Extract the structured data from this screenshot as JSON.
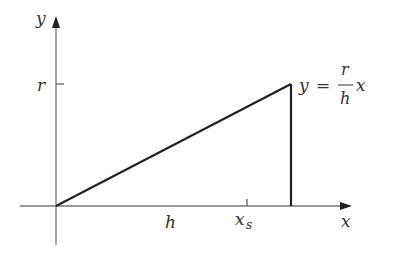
{
  "diagram": {
    "axes": {
      "x_label": "x",
      "y_label": "y",
      "axis_color": "#777777"
    },
    "labels": {
      "r": "r",
      "h": "h",
      "xs_base": "x",
      "xs_sub": "s"
    },
    "equation": {
      "lhs": "y",
      "equals": "=",
      "numerator": "r",
      "denominator": "h",
      "variable": "x"
    },
    "line_color": "#222222"
  }
}
